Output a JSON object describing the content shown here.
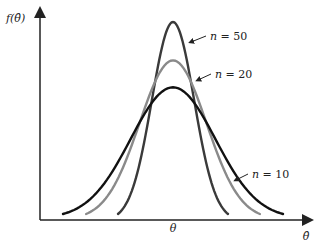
{
  "chart_data": {
    "type": "line",
    "title": "",
    "xlabel": "θ̂",
    "ylabel": "f(θ̂)",
    "center_label": "θ",
    "x_range": [
      -4,
      4
    ],
    "center": 0,
    "grid": false,
    "legend": "inline-annotations",
    "series": [
      {
        "name": "n = 50",
        "label_n": "n",
        "label_eq": "= 50",
        "n": 50,
        "peak_relative": 1.0,
        "spread_relative": 0.5,
        "color": "#3a3a3a"
      },
      {
        "name": "n = 20",
        "label_n": "n",
        "label_eq": "= 20",
        "n": 20,
        "peak_relative": 0.8,
        "spread_relative": 0.79,
        "color": "#8a8a8a"
      },
      {
        "name": "n = 10",
        "label_n": "n",
        "label_eq": "= 10",
        "n": 10,
        "peak_relative": 0.66,
        "spread_relative": 1.0,
        "color": "#111111"
      }
    ]
  },
  "axis": {
    "y_label_prefix": "f(",
    "y_label_var": "θ̂",
    "y_label_suffix": ")",
    "x_label": "θ̂",
    "center_label": "θ"
  }
}
